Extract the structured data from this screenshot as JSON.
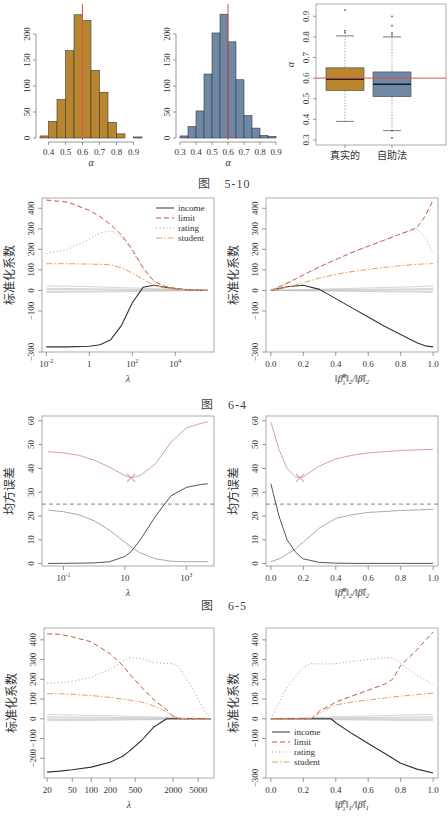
{
  "captions": {
    "fig5_10": {
      "prefix": "图",
      "number": "5-10"
    },
    "fig6_4": {
      "prefix": "图",
      "number": "6-4"
    },
    "fig6_5": {
      "prefix": "图",
      "number": "6-5"
    }
  },
  "colors": {
    "gold": "#B8862F",
    "steel": "#6E88A6",
    "red_line": "#D9534F",
    "income": "#333333",
    "limit": "#C8553D",
    "rating": "#C98A9A",
    "student": "#E8A060",
    "grey_lines": "#BBBBBB",
    "mse_pink": "#D9A0AA",
    "var_grey": "#AAAAAA",
    "bias_dark": "#555555"
  },
  "chart_data": [
    {
      "id": "hist_true",
      "type": "bar",
      "title": "",
      "xlabel": "α",
      "ylabel": "",
      "categories": [
        "0.35-0.40",
        "0.40-0.45",
        "0.45-0.50",
        "0.50-0.55",
        "0.55-0.60",
        "0.60-0.65",
        "0.65-0.70",
        "0.70-0.75",
        "0.75-0.80",
        "0.80-0.85",
        "0.85-0.90",
        "0.90-0.95"
      ],
      "bin_start": 0.35,
      "bin_width": 0.05,
      "values": [
        4,
        32,
        74,
        168,
        237,
        226,
        130,
        88,
        30,
        8,
        0,
        2
      ],
      "xticks": [
        "0.4",
        "0.5",
        "0.6",
        "0.7",
        "0.8",
        "0.9"
      ],
      "yticks": [
        "0",
        "50",
        "100",
        "150",
        "200"
      ],
      "xlim": [
        0.35,
        0.95
      ],
      "ylim": [
        0,
        250
      ],
      "vline": 0.6,
      "color": "#B8862F"
    },
    {
      "id": "hist_bootstrap",
      "type": "bar",
      "title": "",
      "xlabel": "α",
      "ylabel": "",
      "categories": [
        "0.30-0.35",
        "0.35-0.40",
        "0.40-0.45",
        "0.45-0.50",
        "0.50-0.55",
        "0.55-0.60",
        "0.60-0.65",
        "0.65-0.70",
        "0.70-0.75",
        "0.75-0.80",
        "0.80-0.85",
        "0.85-0.90"
      ],
      "bin_start": 0.3,
      "bin_width": 0.05,
      "values": [
        4,
        22,
        52,
        123,
        202,
        238,
        185,
        112,
        43,
        19,
        5,
        3
      ],
      "xticks": [
        "0.3",
        "0.4",
        "0.5",
        "0.6",
        "0.7",
        "0.8",
        "0.9"
      ],
      "yticks": [
        "0",
        "50",
        "100",
        "150",
        "200"
      ],
      "xlim": [
        0.3,
        0.9
      ],
      "ylim": [
        0,
        250
      ],
      "vline": 0.6,
      "color": "#6E88A6"
    },
    {
      "id": "boxplot",
      "type": "box",
      "title": "",
      "xlabel": "",
      "ylabel": "α",
      "categories": [
        "真实的",
        "自助法"
      ],
      "series": [
        {
          "name": "真实的",
          "min": 0.39,
          "q1": 0.54,
          "median": 0.595,
          "q3": 0.65,
          "max": 0.805,
          "outliers": [
            0.82,
            0.83,
            0.93
          ],
          "color": "#B8862F"
        },
        {
          "name": "自助法",
          "min": 0.345,
          "q1": 0.51,
          "median": 0.57,
          "q3": 0.63,
          "max": 0.8,
          "outliers": [
            0.81,
            0.82,
            0.855,
            0.9,
            0.31,
            0.345
          ],
          "color": "#6E88A6"
        }
      ],
      "yticks": [
        "0.3",
        "0.4",
        "0.5",
        "0.6",
        "0.7",
        "0.8",
        "0.9"
      ],
      "ylim": [
        0.29,
        0.95
      ],
      "hline": 0.6
    },
    {
      "id": "ridge_lambda",
      "type": "line",
      "title": "",
      "xlabel": "λ",
      "ylabel": "标准化系数",
      "xscale": "log10",
      "xticks": [
        "10^-2",
        "1",
        "10^2",
        "10^4"
      ],
      "yticks": [
        "-300",
        "-100",
        "0",
        "100",
        "200",
        "300",
        "400"
      ],
      "xlim": [
        -2.2,
        5.8
      ],
      "ylim": [
        -300,
        450
      ],
      "legend": {
        "position": "top-right",
        "entries": [
          "income",
          "limit",
          "rating",
          "student"
        ]
      },
      "x": [
        -2,
        -1,
        0,
        0.5,
        1,
        1.5,
        2,
        2.5,
        3,
        3.5,
        4,
        4.5,
        5,
        5.5
      ],
      "series": [
        {
          "name": "income",
          "style": "solid",
          "values": [
            -275,
            -275,
            -272,
            -265,
            -240,
            -170,
            -60,
            15,
            25,
            15,
            8,
            3,
            1,
            0
          ]
        },
        {
          "name": "limit",
          "style": "dashed",
          "values": [
            440,
            430,
            390,
            360,
            320,
            270,
            200,
            110,
            45,
            20,
            10,
            4,
            1,
            0
          ]
        },
        {
          "name": "rating",
          "style": "dotted",
          "values": [
            180,
            200,
            250,
            280,
            290,
            260,
            190,
            110,
            45,
            20,
            10,
            4,
            1,
            0
          ]
        },
        {
          "name": "student",
          "style": "dashdot",
          "values": [
            130,
            130,
            128,
            127,
            124,
            110,
            85,
            55,
            25,
            12,
            6,
            3,
            1,
            0
          ]
        }
      ]
    },
    {
      "id": "ridge_norm",
      "type": "line",
      "title": "",
      "xlabel": "||β̂λR||2 / ||β̂||2",
      "ylabel": "标准化系数",
      "xticks": [
        "0.0",
        "0.2",
        "0.4",
        "0.6",
        "0.8",
        "1.0"
      ],
      "yticks": [
        "-300",
        "-100",
        "0",
        "100",
        "200",
        "300",
        "400"
      ],
      "xlim": [
        -0.03,
        1.03
      ],
      "ylim": [
        -300,
        450
      ],
      "x": [
        0.0,
        0.1,
        0.2,
        0.3,
        0.4,
        0.5,
        0.6,
        0.7,
        0.8,
        0.9,
        0.95,
        1.0
      ],
      "series": [
        {
          "name": "income",
          "style": "solid",
          "values": [
            0,
            18,
            25,
            5,
            -40,
            -85,
            -130,
            -175,
            -215,
            -255,
            -270,
            -275
          ]
        },
        {
          "name": "limit",
          "style": "dashed",
          "values": [
            0,
            35,
            75,
            115,
            150,
            185,
            215,
            245,
            275,
            305,
            360,
            440
          ]
        },
        {
          "name": "rating",
          "style": "dotted",
          "values": [
            0,
            35,
            75,
            115,
            150,
            185,
            215,
            245,
            275,
            300,
            260,
            180
          ]
        },
        {
          "name": "student",
          "style": "dashdot",
          "values": [
            0,
            15,
            38,
            60,
            78,
            92,
            102,
            112,
            120,
            127,
            129,
            130
          ]
        }
      ]
    },
    {
      "id": "mse_lambda",
      "type": "line",
      "title": "",
      "xlabel": "λ",
      "ylabel": "均方误差",
      "xscale": "log10",
      "xticks": [
        "10^-1",
        "10",
        "10^3"
      ],
      "yticks": [
        "0",
        "10",
        "20",
        "30",
        "40",
        "50",
        "60"
      ],
      "xlim": [
        -1.7,
        3.9
      ],
      "ylim": [
        -1,
        62
      ],
      "hline": 25,
      "min_marker": {
        "x": 1.2,
        "y": 36
      },
      "x": [
        -1.5,
        -1,
        -0.5,
        0,
        0.5,
        1,
        1.2,
        1.5,
        2,
        2.5,
        3,
        3.5,
        3.7
      ],
      "series": [
        {
          "name": "test MSE",
          "style": "solid",
          "values": [
            47,
            46.5,
            45.5,
            43.5,
            40.5,
            37,
            36,
            37,
            42,
            51,
            57,
            59,
            59.5
          ]
        },
        {
          "name": "variance",
          "style": "solid",
          "values": [
            22.5,
            21.8,
            20.5,
            18,
            14,
            9,
            7,
            4.5,
            2,
            1,
            0.8,
            0.8,
            0.8
          ]
        },
        {
          "name": "squared bias",
          "style": "solid",
          "values": [
            0.1,
            0.1,
            0.2,
            0.3,
            0.8,
            3,
            5,
            10,
            20,
            28.5,
            32,
            33.3,
            33.5
          ]
        }
      ]
    },
    {
      "id": "mse_norm",
      "type": "line",
      "title": "",
      "xlabel": "||β̂λR||2 / ||β̂||2",
      "ylabel": "均方误差",
      "xticks": [
        "0.0",
        "0.2",
        "0.4",
        "0.6",
        "0.8",
        "1.0"
      ],
      "yticks": [
        "0",
        "10",
        "20",
        "30",
        "40",
        "50",
        "60"
      ],
      "xlim": [
        -0.03,
        1.03
      ],
      "ylim": [
        -1,
        62
      ],
      "hline": 25,
      "min_marker": {
        "x": 0.18,
        "y": 36
      },
      "x": [
        0.0,
        0.05,
        0.1,
        0.15,
        0.18,
        0.2,
        0.3,
        0.4,
        0.5,
        0.6,
        0.8,
        1.0
      ],
      "series": [
        {
          "name": "test MSE",
          "style": "solid",
          "values": [
            59.5,
            48,
            40,
            36.5,
            36,
            36.5,
            41,
            44,
            45.5,
            46.5,
            47.5,
            48
          ]
        },
        {
          "name": "variance",
          "style": "solid",
          "values": [
            0.8,
            2,
            4,
            6,
            8,
            9,
            15,
            19,
            20.5,
            21.5,
            22.3,
            22.8
          ]
        },
        {
          "name": "squared bias",
          "style": "solid",
          "values": [
            33.5,
            20,
            10,
            5,
            3,
            2,
            0.5,
            0.2,
            0.1,
            0.1,
            0.1,
            0.1
          ]
        }
      ]
    },
    {
      "id": "lasso_lambda",
      "type": "line",
      "title": "",
      "xlabel": "λ",
      "ylabel": "标准化系数",
      "xscale": "log10",
      "xticks": [
        "20",
        "50",
        "100",
        "200",
        "500",
        "2000",
        "5000"
      ],
      "yticks": [
        "-200",
        "-100",
        "0",
        "100",
        "200",
        "300",
        "400"
      ],
      "xlim": [
        1.25,
        3.95
      ],
      "ylim": [
        -300,
        460
      ],
      "x": [
        1.3,
        1.5,
        1.7,
        2.0,
        2.3,
        2.5,
        2.6,
        2.8,
        3.0,
        3.2,
        3.3,
        3.4,
        3.6,
        3.8,
        3.9
      ],
      "series": [
        {
          "name": "income",
          "style": "solid",
          "values": [
            -270,
            -265,
            -258,
            -245,
            -220,
            -190,
            -165,
            -110,
            -40,
            0,
            0,
            0,
            0,
            0,
            0
          ]
        },
        {
          "name": "limit",
          "style": "dashed",
          "values": [
            430,
            428,
            415,
            390,
            330,
            270,
            230,
            160,
            95,
            45,
            10,
            0,
            0,
            0,
            0
          ]
        },
        {
          "name": "rating",
          "style": "dotted",
          "values": [
            180,
            182,
            190,
            210,
            250,
            290,
            310,
            305,
            285,
            280,
            280,
            260,
            160,
            40,
            0
          ]
        },
        {
          "name": "student",
          "style": "dashdot",
          "values": [
            127,
            127,
            124,
            118,
            108,
            100,
            95,
            85,
            65,
            35,
            15,
            2,
            0,
            0,
            0
          ]
        }
      ]
    },
    {
      "id": "lasso_norm",
      "type": "line",
      "title": "",
      "xlabel": "||β̂λL||1 / ||β̂||1",
      "ylabel": "标准化系数",
      "xticks": [
        "0.0",
        "0.2",
        "0.4",
        "0.6",
        "0.8",
        "1.0"
      ],
      "yticks": [
        "-300",
        "-100",
        "0",
        "100",
        "200",
        "300",
        "400"
      ],
      "xlim": [
        -0.03,
        1.03
      ],
      "ylim": [
        -300,
        460
      ],
      "legend": {
        "position": "bottom-left",
        "entries": [
          "income",
          "limit",
          "rating",
          "student"
        ]
      },
      "x": [
        0.0,
        0.05,
        0.1,
        0.2,
        0.25,
        0.3,
        0.37,
        0.4,
        0.5,
        0.6,
        0.7,
        0.75,
        0.8,
        0.9,
        1.0
      ],
      "series": [
        {
          "name": "income",
          "style": "solid",
          "values": [
            0,
            0,
            0,
            0,
            0,
            0,
            0,
            -20,
            -75,
            -125,
            -175,
            -200,
            -225,
            -255,
            -275
          ]
        },
        {
          "name": "limit",
          "style": "dashed",
          "values": [
            0,
            0,
            0,
            0,
            0,
            40,
            70,
            85,
            115,
            145,
            175,
            200,
            270,
            350,
            440
          ]
        },
        {
          "name": "rating",
          "style": "dotted",
          "values": [
            0,
            80,
            160,
            260,
            280,
            278,
            278,
            280,
            290,
            300,
            310,
            308,
            280,
            220,
            175
          ]
        },
        {
          "name": "student",
          "style": "dashdot",
          "values": [
            0,
            0,
            0,
            0,
            0,
            30,
            60,
            70,
            85,
            95,
            105,
            110,
            115,
            122,
            130
          ]
        }
      ]
    }
  ],
  "labels": {
    "alpha": "α",
    "lambda": "λ",
    "std_coef": "标准化系数",
    "mse": "均方误差",
    "box_true": "真实的",
    "box_boot": "自助法",
    "ridge_norm_label": "||β̂λR||2/||β̂||2",
    "lasso_norm_label": "||β̂λL||1/||β̂||1",
    "legend": [
      "income",
      "limit",
      "rating",
      "student"
    ]
  }
}
